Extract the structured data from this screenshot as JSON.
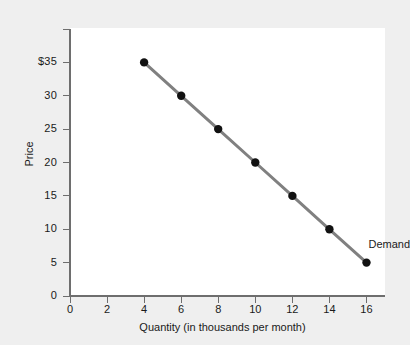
{
  "chart_data": {
    "type": "line",
    "title": "",
    "xlabel": "Quantity (in thousands per month)",
    "ylabel": "Price",
    "x": [
      4,
      6,
      8,
      10,
      12,
      14,
      16
    ],
    "values": [
      35,
      30,
      25,
      20,
      15,
      10,
      5
    ],
    "series": [
      {
        "name": "Demand",
        "x": [
          4,
          6,
          8,
          10,
          12,
          14,
          16
        ],
        "values": [
          35,
          30,
          25,
          20,
          15,
          10,
          5
        ]
      }
    ],
    "xlim": [
      0,
      17
    ],
    "ylim": [
      0,
      40
    ],
    "xticks": [
      0,
      2,
      4,
      6,
      8,
      10,
      12,
      14,
      16
    ],
    "xtick_labels": [
      "0",
      "2",
      "4",
      "6",
      "8",
      "10",
      "12",
      "14",
      "16"
    ],
    "yticks": [
      0,
      5,
      10,
      15,
      20,
      25,
      30,
      35
    ],
    "ytick_labels": [
      "0",
      "5",
      "10",
      "15",
      "20",
      "25",
      "30",
      "$35"
    ],
    "grid": false,
    "legend": "none",
    "annotations": [
      {
        "text": "Demand",
        "x": 16,
        "y": 7.5
      }
    ],
    "colors": {
      "line": "#808080",
      "marker": "#111111",
      "axis": "#6e6e6e",
      "plot_background": "#ffffff",
      "figure_background": "#efefef",
      "text": "#1a1a1a"
    }
  }
}
